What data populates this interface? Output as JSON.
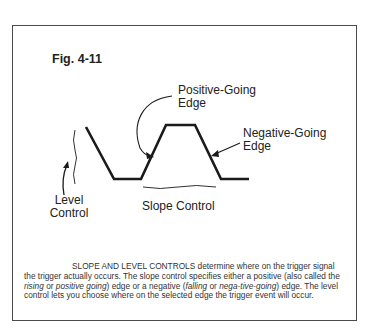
{
  "figure": {
    "label": "Fig. 4-11",
    "annotations": {
      "positive_edge": [
        "Positive-Going",
        "Edge"
      ],
      "negative_edge": [
        "Negative-Going",
        "Edge"
      ],
      "level_control": [
        "Level",
        "Control"
      ],
      "slope_control": "Slope Control"
    },
    "caption": {
      "lead": "SLOPE AND LEVEL CONTROLS",
      "part1": " determine where on the trigger signal the trigger actually occurs. The slope control specifies either a positive (also called the ",
      "italic1": "rising",
      "part2": " or ",
      "italic2": "positive going",
      "part3": ") edge or a negative (",
      "italic3": "falling",
      "part4": " or ",
      "italic4": "nega-tive-going",
      "part5": ") edge. The level control lets you choose where on the selected edge the trigger event will occur."
    }
  },
  "colors": {
    "frame": "#4a4a4a",
    "waveform": "#1a1a1a",
    "text": "#222222"
  }
}
